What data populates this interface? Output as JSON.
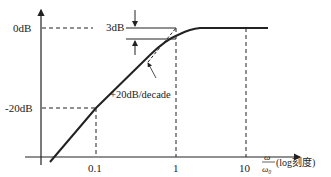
{
  "diagram": {
    "type": "bode-magnitude-highpass",
    "y_axis": {
      "labels": [
        "0dB",
        "-20dB"
      ]
    },
    "x_axis": {
      "ticks": [
        "0.1",
        "1",
        "10"
      ],
      "label_num": "ω",
      "label_den": "ω₀",
      "label_suffix": "(log刻度)"
    },
    "annotations": {
      "three_db": "3dB",
      "slope": "+20dB/decade"
    },
    "colors": {
      "line": "#222222",
      "background": "#ffffff"
    }
  }
}
